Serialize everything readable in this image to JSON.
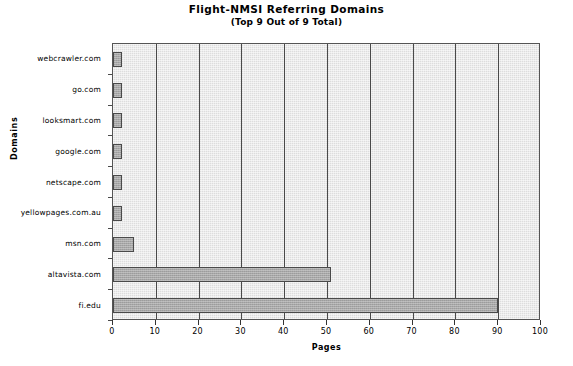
{
  "chart_data": {
    "type": "bar",
    "orientation": "horizontal",
    "title": "Flight-NMSI Referring Domains",
    "subtitle": "(Top 9 Out of 9 Total)",
    "xlabel": "Pages",
    "ylabel": "Domains",
    "categories": [
      "webcrawler.com",
      "go.com",
      "looksmart.com",
      "google.com",
      "netscape.com",
      "yellowpages.com.au",
      "msn.com",
      "altavista.com",
      "fi.edu"
    ],
    "values": [
      2,
      2,
      2,
      2,
      2,
      2,
      5,
      51,
      90
    ],
    "xlim": [
      0,
      100
    ],
    "xticks": [
      0,
      10,
      20,
      30,
      40,
      50,
      60,
      70,
      80,
      90,
      100
    ],
    "xtick_labels": [
      "0",
      "10",
      "20",
      "30",
      "40",
      "50",
      "60",
      "70",
      "80",
      "90",
      "100"
    ],
    "grid": "vertical",
    "legend": "none",
    "colors": {
      "bar_fill": "#a8a8a8",
      "bar_border": "#4a4a4a",
      "plot_background": "#dddddd",
      "gridline": "#4a4a4a",
      "page_background": "#ffffff",
      "text": "#000000"
    }
  }
}
